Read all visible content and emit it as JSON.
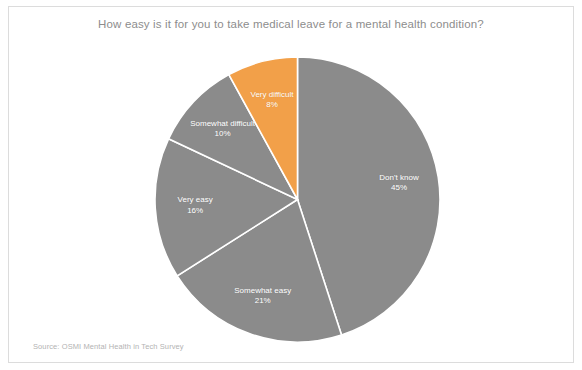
{
  "chart_data": {
    "type": "pie",
    "title": "How easy is it for you to take medical leave for a mental health condition?",
    "source": "Source: OSMI Mental Health in Tech Survey",
    "xlabel": "",
    "ylabel": "",
    "legend_position": "none",
    "grid": false,
    "start_angle_deg": 0,
    "direction": "clockwise",
    "categories": [
      "Don't know",
      "Somewhat easy",
      "Very easy",
      "Somewhat difficult",
      "Very difficult"
    ],
    "values": [
      45,
      21,
      16,
      10,
      8
    ],
    "labels": [
      "45%",
      "21%",
      "16%",
      "10%",
      "8%"
    ],
    "colors": [
      "#8b8b8b",
      "#8b8b8b",
      "#8b8b8b",
      "#8b8b8b",
      "#f2a049"
    ],
    "accent_color": "#f2a049",
    "base_color": "#8b8b8b",
    "wedge_edge_color": "#ffffff",
    "slices": [
      {
        "name": "Don't know",
        "value": 45,
        "label": "45%",
        "color": "#8b8b8b"
      },
      {
        "name": "Somewhat easy",
        "value": 21,
        "label": "21%",
        "color": "#8b8b8b"
      },
      {
        "name": "Very easy",
        "value": 16,
        "label": "16%",
        "color": "#8b8b8b"
      },
      {
        "name": "Somewhat difficult",
        "value": 10,
        "label": "10%",
        "color": "#8b8b8b"
      },
      {
        "name": "Very difficult",
        "value": 8,
        "label": "8%",
        "color": "#f2a049"
      }
    ]
  }
}
